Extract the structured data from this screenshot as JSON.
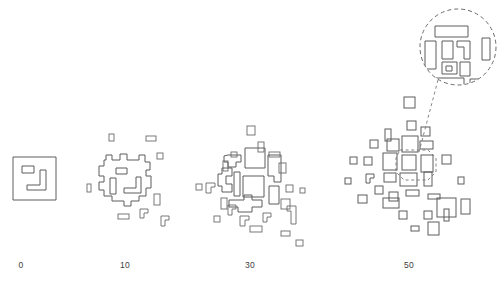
{
  "figure": {
    "type": "diagram",
    "background_color": "#ffffff",
    "stroke_color": "#5d5d5d",
    "dash_color": "#6a6a6a",
    "width": 503,
    "height": 288
  },
  "axis": {
    "labels": [
      {
        "text": "0",
        "x": 21
      },
      {
        "text": "10",
        "x": 125
      },
      {
        "text": "30",
        "x": 250
      },
      {
        "text": "50",
        "x": 409
      }
    ],
    "label_y": 265
  },
  "stages": [
    {
      "name": "stage-0",
      "label": "0",
      "center_x": 35,
      "fragment_count": 1,
      "shapes": [
        {
          "name": "outer-frame",
          "d": "M13,157 L56,157 L56,200 L13,200 Z"
        },
        {
          "name": "inner-small-rect",
          "d": "M22,166 L34,166 L34,173 L22,173 Z"
        },
        {
          "name": "inner-l-shape",
          "d": "M40,170 L46,170 L46,190 L27,190 L27,185 L40,185 Z"
        }
      ],
      "satellites": []
    },
    {
      "name": "stage-10",
      "label": "10",
      "center_x": 125,
      "fragment_count": 9,
      "shapes": [
        {
          "name": "jagged-core",
          "d": "M106,160 L106,155 L112,155 L112,160 L120,160 L120,154 L127,154 L127,160 L139,160 L139,155 L145,155 L145,162 L150,162 L150,170 L146,170 L146,176 L151,176 L151,188 L146,188 L146,196 L139,196 L139,201 L131,201 L131,206 L124,206 L124,201 L112,201 L112,196 L104,196 L104,190 L99,190 L99,182 L104,182 L104,176 L99,176 L99,166 L104,166 L104,160 Z"
        },
        {
          "name": "core-inner-rect-small",
          "d": "M116,168 L127,168 L127,174 L116,174 Z"
        },
        {
          "name": "core-inner-vertical-bar",
          "d": "M110,178 L116,178 L116,194 L110,194 Z"
        },
        {
          "name": "core-inner-l-shape",
          "d": "M136,177 L141,177 L141,193 L124,193 L124,188 L136,188 Z"
        }
      ],
      "satellites": [
        {
          "name": "satellite-rect",
          "x": 109,
          "y": 134,
          "w": 5,
          "h": 7
        },
        {
          "name": "satellite-rect",
          "x": 146,
          "y": 136,
          "w": 10,
          "h": 5
        },
        {
          "name": "satellite-rect",
          "x": 157,
          "y": 153,
          "w": 6,
          "h": 6
        },
        {
          "name": "satellite-rect",
          "x": 87,
          "y": 184,
          "w": 4,
          "h": 8
        },
        {
          "name": "satellite-rect",
          "x": 154,
          "y": 194,
          "w": 6,
          "h": 11
        },
        {
          "name": "satellite-rect",
          "x": 118,
          "y": 214,
          "w": 11,
          "h": 5
        },
        {
          "name": "satellite-l",
          "d": "M140,209 L148,209 L148,213 L144,213 L144,218 L140,218 Z"
        },
        {
          "name": "satellite-l",
          "d": "M161,216 L169,216 L169,220 L165,220 L165,226 L161,226 Z"
        }
      ]
    },
    {
      "name": "stage-30",
      "label": "30",
      "center_x": 250,
      "fragment_count": 28,
      "shapes": [
        {
          "name": "core-fragment-upper-left",
          "d": "M228,155 L241,155 L241,162 L236,162 L236,167 L228,167 L228,162 L224,162 L224,156 Z"
        },
        {
          "name": "core-fragment-upper-mid",
          "d": "M245,148 L265,148 L265,168 L245,168 Z"
        },
        {
          "name": "core-fragment-upper-right",
          "d": "M268,155 L281,155 L281,182 L274,182 L274,176 L268,176 Z"
        },
        {
          "name": "core-fragment-left-zig",
          "d": "M222,168 L232,168 L232,176 L226,176 L226,184 L232,184 L232,192 L222,192 L222,186 L218,186 L218,174 L222,174 Z"
        },
        {
          "name": "core-fragment-center-square",
          "d": "M243,176 L264,176 L264,197 L243,197 Z"
        },
        {
          "name": "core-fragment-mid-left",
          "d": "M234,172 L240,172 L240,196 L234,196 Z"
        },
        {
          "name": "core-fragment-lower-zig",
          "d": "M229,200 L244,200 L244,195 L252,195 L252,200 L262,200 L262,207 L252,207 L252,212 L238,212 L238,207 L229,207 Z"
        },
        {
          "name": "core-fragment-right-tall",
          "d": "M269,186 L279,186 L279,204 L269,204 Z"
        }
      ],
      "satellites": [
        {
          "name": "satellite-rect",
          "x": 247,
          "y": 126,
          "w": 8,
          "h": 9
        },
        {
          "name": "satellite-rect",
          "x": 258,
          "y": 142,
          "w": 6,
          "h": 10
        },
        {
          "name": "satellite-rect",
          "x": 231,
          "y": 152,
          "w": 6,
          "h": 5
        },
        {
          "name": "satellite-rect",
          "x": 269,
          "y": 152,
          "w": 11,
          "h": 5
        },
        {
          "name": "satellite-rect",
          "x": 223,
          "y": 161,
          "w": 5,
          "h": 10
        },
        {
          "name": "satellite-rect",
          "x": 279,
          "y": 163,
          "w": 7,
          "h": 10
        },
        {
          "name": "satellite-rect",
          "x": 196,
          "y": 184,
          "w": 6,
          "h": 6
        },
        {
          "name": "satellite-rect",
          "x": 286,
          "y": 185,
          "w": 7,
          "h": 7
        },
        {
          "name": "satellite-rect",
          "x": 300,
          "y": 188,
          "w": 5,
          "h": 5
        },
        {
          "name": "satellite-rect",
          "x": 221,
          "y": 198,
          "w": 6,
          "h": 11
        },
        {
          "name": "satellite-rect",
          "x": 281,
          "y": 199,
          "w": 9,
          "h": 10
        },
        {
          "name": "satellite-rect",
          "x": 214,
          "y": 216,
          "w": 6,
          "h": 6
        },
        {
          "name": "satellite-rect",
          "x": 250,
          "y": 226,
          "w": 12,
          "h": 6
        },
        {
          "name": "satellite-rect",
          "x": 281,
          "y": 231,
          "w": 9,
          "h": 5
        },
        {
          "name": "satellite-rect",
          "x": 296,
          "y": 240,
          "w": 7,
          "h": 6
        },
        {
          "name": "satellite-l",
          "d": "M206,183 L215,183 L215,187 L211,187 L211,193 L206,193 Z"
        },
        {
          "name": "satellite-l",
          "d": "M228,205 L236,205 L236,209 L232,209 L232,215 L228,215 Z"
        },
        {
          "name": "satellite-l",
          "d": "M240,216 L249,216 L249,220 L245,220 L245,226 L240,226 Z"
        },
        {
          "name": "satellite-l",
          "d": "M263,213 L271,213 L271,217 L267,217 L267,222 L263,222 Z"
        },
        {
          "name": "satellite-l",
          "d": "M287,206 L296,206 L296,224 L291,224 L291,211 L287,211 Z"
        }
      ]
    },
    {
      "name": "stage-50",
      "label": "50",
      "center_x": 409,
      "fragment_count": 44,
      "shapes": [],
      "satellites": [
        {
          "name": "fragment-rect",
          "x": 404,
          "y": 97,
          "w": 11,
          "h": 11
        },
        {
          "name": "fragment-rect",
          "x": 407,
          "y": 121,
          "w": 9,
          "h": 9
        },
        {
          "name": "fragment-rect",
          "x": 385,
          "y": 129,
          "w": 6,
          "h": 12
        },
        {
          "name": "fragment-rect",
          "x": 421,
          "y": 127,
          "w": 9,
          "h": 9
        },
        {
          "name": "fragment-rect",
          "x": 370,
          "y": 140,
          "w": 8,
          "h": 8
        },
        {
          "name": "fragment-rect",
          "x": 387,
          "y": 139,
          "w": 12,
          "h": 12
        },
        {
          "name": "fragment-rect",
          "x": 402,
          "y": 136,
          "w": 16,
          "h": 16
        },
        {
          "name": "fragment-rect",
          "x": 420,
          "y": 141,
          "w": 13,
          "h": 8
        },
        {
          "name": "fragment-rect",
          "x": 350,
          "y": 157,
          "w": 7,
          "h": 7
        },
        {
          "name": "fragment-rect",
          "x": 364,
          "y": 157,
          "w": 8,
          "h": 8
        },
        {
          "name": "fragment-rect",
          "x": 383,
          "y": 153,
          "w": 14,
          "h": 17
        },
        {
          "name": "fragment-rect",
          "x": 402,
          "y": 155,
          "w": 14,
          "h": 15
        },
        {
          "name": "fragment-rect",
          "x": 421,
          "y": 155,
          "w": 12,
          "h": 17
        },
        {
          "name": "fragment-rect",
          "x": 442,
          "y": 155,
          "w": 9,
          "h": 9
        },
        {
          "name": "fragment-rect",
          "x": 384,
          "y": 173,
          "w": 12,
          "h": 9
        },
        {
          "name": "fragment-rect",
          "x": 400,
          "y": 173,
          "w": 17,
          "h": 13
        },
        {
          "name": "fragment-rect",
          "x": 424,
          "y": 172,
          "w": 8,
          "h": 14
        },
        {
          "name": "fragment-rect",
          "x": 375,
          "y": 186,
          "w": 8,
          "h": 8
        },
        {
          "name": "fragment-rect",
          "x": 389,
          "y": 192,
          "w": 9,
          "h": 9
        },
        {
          "name": "fragment-rect",
          "x": 406,
          "y": 190,
          "w": 13,
          "h": 6
        },
        {
          "name": "fragment-rect",
          "x": 358,
          "y": 195,
          "w": 9,
          "h": 8
        },
        {
          "name": "fragment-rect",
          "x": 383,
          "y": 198,
          "w": 16,
          "h": 10
        },
        {
          "name": "fragment-rect",
          "x": 428,
          "y": 194,
          "w": 12,
          "h": 5
        },
        {
          "name": "fragment-rect",
          "x": 437,
          "y": 198,
          "w": 19,
          "h": 19
        },
        {
          "name": "fragment-rect",
          "x": 461,
          "y": 199,
          "w": 9,
          "h": 15
        },
        {
          "name": "fragment-rect",
          "x": 399,
          "y": 211,
          "w": 8,
          "h": 8
        },
        {
          "name": "fragment-rect",
          "x": 424,
          "y": 211,
          "w": 8,
          "h": 8
        },
        {
          "name": "fragment-rect",
          "x": 444,
          "y": 209,
          "w": 5,
          "h": 12
        },
        {
          "name": "fragment-rect",
          "x": 411,
          "y": 226,
          "w": 8,
          "h": 5
        },
        {
          "name": "fragment-rect",
          "x": 428,
          "y": 222,
          "w": 11,
          "h": 13
        },
        {
          "name": "fragment-rect",
          "x": 345,
          "y": 178,
          "w": 6,
          "h": 6
        },
        {
          "name": "fragment-rect",
          "x": 458,
          "y": 177,
          "w": 6,
          "h": 7
        },
        {
          "name": "fragment-l",
          "d": "M366,174 L374,174 L374,178 L370,178 L370,183 L366,183 Z"
        }
      ]
    }
  ],
  "inset": {
    "name": "magnified-inset",
    "center_x": 458,
    "center_y": 47,
    "radius": 39,
    "style": "dashed-circle",
    "magnified_region": {
      "name": "source-region-outline",
      "center_x": 414,
      "center_y": 163,
      "width": 36,
      "height": 30
    },
    "leader_line": {
      "name": "inset-leader",
      "from_x": 438,
      "from_y": 78,
      "to_x": 420,
      "to_y": 150
    },
    "shapes": [
      {
        "name": "inset-fragment-top",
        "d": "M435,26 L468,26 L468,37 L435,37 Z"
      },
      {
        "name": "inset-fragment-left",
        "d": "M425,41 L436,41 L436,69 L425,69 Z"
      },
      {
        "name": "inset-fragment-upper-mid",
        "d": "M442,41 L453,41 L453,59 L442,59 Z"
      },
      {
        "name": "inset-fragment-upper-right-l",
        "d": "M457,41 L470,41 L470,59 L464,59 L464,47 L457,47 Z"
      },
      {
        "name": "inset-fragment-lower-mid",
        "d": "M442,62 L457,62 L457,74 L442,74 Z"
      },
      {
        "name": "inset-fragment-lower-mid-hole",
        "d": "M446,66 L452,66 L452,71 L446,71 Z"
      },
      {
        "name": "inset-fragment-lower-right",
        "d": "M460,62 L470,62 L470,76 L460,76 Z"
      },
      {
        "name": "inset-fragment-right-edge",
        "d": "M482,38 L490,38 L490,60 L482,60 Z"
      },
      {
        "name": "inset-fragment-bottom",
        "d": "M433,78 L464,78 L464,92 L433,92 Z"
      },
      {
        "name": "inset-fragment-bottom-right-l",
        "d": "M470,79 L482,79 L482,84 L476,84 L476,90 L470,90 Z"
      }
    ]
  }
}
